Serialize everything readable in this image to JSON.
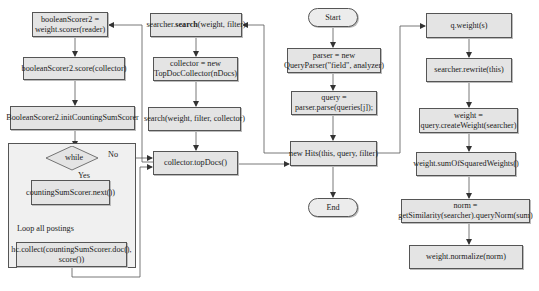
{
  "diagram": {
    "type": "flowchart",
    "left_column": {
      "scorer_assign": [
        "booleanScorer2 =",
        "weight.scorer(reader)"
      ],
      "score_call": "booleanScorer2.score(collector)",
      "init_counting": "BooleanScorer2.initCountingSumScorer",
      "loop": {
        "decision": "while",
        "yes_label": "Yes",
        "no_label": "No",
        "next_call": "countingSumScorer.next())",
        "loop_label": "Loop all postings",
        "collect_call": [
          "hc.collect(countingSumScorer.doc(),",
          "score())"
        ]
      }
    },
    "search_column": {
      "search_prefix": "searcher.",
      "search_bold": "search",
      "search_suffix": "(weight, filter)",
      "collector_new": [
        "collector = new",
        "TopDocCollector(nDocs)"
      ],
      "search_with_collector": "search(weight, filter, collector)",
      "top_docs": "collector.topDocs()"
    },
    "main_column": {
      "start": "Start",
      "parser_new": [
        "parser = new",
        "QueryParser(\"field\", analyzer)"
      ],
      "query_parse": [
        "query =",
        "parser.parse(queries[j]);"
      ],
      "new_hits": "new Hits(this, query, filter)",
      "end": "End"
    },
    "weight_column": {
      "q_weight": "q.weight(s)",
      "rewrite": "searcher.rewrite(this)",
      "create_weight": [
        "weight =",
        "query.createWeight(searcher)"
      ],
      "sum_squared": "weight.sumOfSquaredWeights()",
      "norm": [
        "norm =",
        "getSimilarity(searcher).queryNorm(sum)"
      ],
      "normalize": "weight.normalize(norm)"
    }
  },
  "colors": {
    "box_fill": "#e4e4e4",
    "container_fill": "#f0f0f0",
    "stroke": "#555555"
  }
}
